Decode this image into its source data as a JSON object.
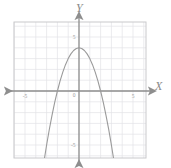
{
  "chart_data": {
    "type": "line",
    "title": "",
    "subtitle": "",
    "xlabel": "X",
    "ylabel": "Y",
    "xlim": [
      -6.0,
      6.2
    ],
    "ylim": [
      -6.6,
      6.6
    ],
    "grid": true,
    "grid_step": 1,
    "legend": "none",
    "axis_origin_label": "0",
    "x_tick_labels": [
      "-5",
      "5"
    ],
    "x_tick_values": [
      -5,
      5
    ],
    "y_tick_labels": [
      "5",
      "-5"
    ],
    "y_tick_values": [
      5,
      -5
    ],
    "annotations": [],
    "series": [
      {
        "name": "parabola",
        "equation": "y = -x^2 + 4",
        "vertex": [
          0,
          4
        ],
        "x_intercepts": [
          -2,
          2
        ],
        "y_intercept": 4,
        "opens": "down",
        "color": "#9a9a9a",
        "x": [
          -3.3,
          -3.0,
          -2.75,
          -2.5,
          -2.25,
          -2.0,
          -1.75,
          -1.5,
          -1.25,
          -1.0,
          -0.75,
          -0.5,
          -0.25,
          0,
          0.25,
          0.5,
          0.75,
          1.0,
          1.25,
          1.5,
          1.75,
          2.0,
          2.25,
          2.5,
          2.75,
          3.0,
          3.3
        ],
        "y": [
          -6.89,
          -5.0,
          -3.5625,
          -2.25,
          -1.0625,
          0,
          0.9375,
          1.75,
          2.4375,
          3.0,
          3.4375,
          3.75,
          3.9375,
          4.0,
          3.9375,
          3.75,
          3.4375,
          3.0,
          2.4375,
          1.75,
          0.9375,
          0,
          -1.0625,
          -2.25,
          -3.5625,
          -5.0,
          -6.89
        ]
      }
    ]
  },
  "axes": {
    "x_letter": "X",
    "y_letter": "Y"
  },
  "colors": {
    "curve": "#9a9a9a",
    "axis": "#8e8e8e",
    "grid": "#e3e3e6",
    "frame": "#c9c9cc",
    "label": "#9c9c9c"
  }
}
